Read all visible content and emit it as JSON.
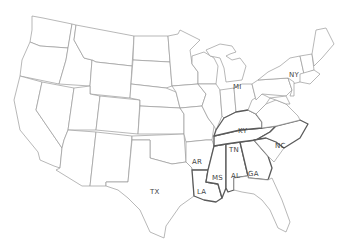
{
  "map": {
    "caption": "",
    "region": "Contiguous United States",
    "style": "outline map, hand-lettered state abbreviations",
    "colors": {
      "border": "#9a9a9a",
      "highlight_border": "#5a5a5a",
      "label": "#444444",
      "fill": "#ffffff"
    },
    "labels": [
      {
        "id": "MI",
        "text": "MI"
      },
      {
        "id": "NY",
        "text": "NY"
      },
      {
        "id": "KY",
        "text": "KY"
      },
      {
        "id": "TN",
        "text": "TN"
      },
      {
        "id": "NC",
        "text": "NC"
      },
      {
        "id": "AR",
        "text": "AR"
      },
      {
        "id": "MS",
        "text": "MS"
      },
      {
        "id": "AL",
        "text": "AL"
      },
      {
        "id": "GA",
        "text": "GA"
      },
      {
        "id": "LA",
        "text": "LA"
      },
      {
        "id": "TX",
        "text": "TX"
      }
    ],
    "highlighted_states": [
      "KY",
      "TN",
      "MS",
      "AL",
      "GA",
      "LA",
      "NC"
    ]
  }
}
